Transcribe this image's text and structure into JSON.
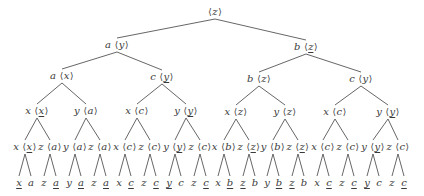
{
  "diagram": {
    "type": "tree",
    "line_color": "#555555",
    "text_color": "#3a3a3a",
    "nodes": [
      {
        "id": "n0",
        "label": "",
        "tag": "z",
        "tag_underlined": false,
        "x": 215,
        "y": 12,
        "parent": null
      },
      {
        "id": "n1",
        "label": "a",
        "tag": "y",
        "tag_underlined": false,
        "x": 117,
        "y": 45,
        "parent": "n0"
      },
      {
        "id": "n2",
        "label": "b",
        "tag": "z",
        "tag_underlined": true,
        "x": 306,
        "y": 47,
        "parent": "n0"
      },
      {
        "id": "n3",
        "label": "a",
        "tag": "x",
        "tag_underlined": false,
        "x": 62,
        "y": 76,
        "parent": "n1"
      },
      {
        "id": "n4",
        "label": "c",
        "tag": "y",
        "tag_underlined": true,
        "x": 162,
        "y": 77,
        "parent": "n1"
      },
      {
        "id": "n5",
        "label": "b",
        "tag": "z",
        "tag_underlined": false,
        "x": 259,
        "y": 79,
        "parent": "n2"
      },
      {
        "id": "n6",
        "label": "c",
        "tag": "y",
        "tag_underlined": false,
        "x": 361,
        "y": 79,
        "parent": "n2"
      },
      {
        "id": "n7",
        "label": "x",
        "tag": "x",
        "tag_underlined": true,
        "x": 37,
        "y": 111,
        "parent": "n3"
      },
      {
        "id": "n8",
        "label": "y",
        "tag": "a",
        "tag_underlined": false,
        "x": 86,
        "y": 111,
        "parent": "n3"
      },
      {
        "id": "n9",
        "label": "x",
        "tag": "c",
        "tag_underlined": false,
        "x": 137,
        "y": 111,
        "parent": "n4"
      },
      {
        "id": "n10",
        "label": "y",
        "tag": "y",
        "tag_underlined": true,
        "x": 186,
        "y": 111,
        "parent": "n4"
      },
      {
        "id": "n11",
        "label": "x",
        "tag": "z",
        "tag_underlined": false,
        "x": 236,
        "y": 112,
        "parent": "n5"
      },
      {
        "id": "n12",
        "label": "y",
        "tag": "z",
        "tag_underlined": false,
        "x": 285,
        "y": 112,
        "parent": "n5"
      },
      {
        "id": "n13",
        "label": "x",
        "tag": "c",
        "tag_underlined": false,
        "x": 335,
        "y": 112,
        "parent": "n6"
      },
      {
        "id": "n14",
        "label": "y",
        "tag": "y",
        "tag_underlined": true,
        "x": 388,
        "y": 112,
        "parent": "n6"
      },
      {
        "id": "n15",
        "label": "x",
        "tag": "x",
        "tag_underlined": true,
        "x": 25,
        "y": 147,
        "parent": "n7"
      },
      {
        "id": "n16",
        "label": "z",
        "tag": "a",
        "tag_underlined": false,
        "x": 50,
        "y": 147,
        "parent": "n7"
      },
      {
        "id": "n17",
        "label": "y",
        "tag": "a",
        "tag_underlined": false,
        "x": 75,
        "y": 147,
        "parent": "n8"
      },
      {
        "id": "n18",
        "label": "z",
        "tag": "a",
        "tag_underlined": false,
        "x": 100,
        "y": 147,
        "parent": "n8"
      },
      {
        "id": "n19",
        "label": "x",
        "tag": "c",
        "tag_underlined": false,
        "x": 125,
        "y": 147,
        "parent": "n9"
      },
      {
        "id": "n20",
        "label": "z",
        "tag": "c",
        "tag_underlined": false,
        "x": 150,
        "y": 147,
        "parent": "n9"
      },
      {
        "id": "n21",
        "label": "y",
        "tag": "y",
        "tag_underlined": true,
        "x": 175,
        "y": 147,
        "parent": "n10"
      },
      {
        "id": "n22",
        "label": "z",
        "tag": "c",
        "tag_underlined": false,
        "x": 200,
        "y": 147,
        "parent": "n10"
      },
      {
        "id": "n23",
        "label": "x",
        "tag": "b",
        "tag_underlined": false,
        "x": 224,
        "y": 147,
        "parent": "n11"
      },
      {
        "id": "n24",
        "label": "z",
        "tag": "z",
        "tag_underlined": true,
        "x": 249,
        "y": 147,
        "parent": "n11"
      },
      {
        "id": "n25",
        "label": "y",
        "tag": "b",
        "tag_underlined": false,
        "x": 273,
        "y": 147,
        "parent": "n12"
      },
      {
        "id": "n26",
        "label": "z",
        "tag": "z",
        "tag_underlined": true,
        "x": 298,
        "y": 147,
        "parent": "n12"
      },
      {
        "id": "n27",
        "label": "x",
        "tag": "c",
        "tag_underlined": false,
        "x": 323,
        "y": 147,
        "parent": "n13"
      },
      {
        "id": "n28",
        "label": "z",
        "tag": "c",
        "tag_underlined": false,
        "x": 348,
        "y": 147,
        "parent": "n13"
      },
      {
        "id": "n29",
        "label": "y",
        "tag": "y",
        "tag_underlined": true,
        "x": 373,
        "y": 147,
        "parent": "n14"
      },
      {
        "id": "n30",
        "label": "z",
        "tag": "c",
        "tag_underlined": false,
        "x": 398,
        "y": 147,
        "parent": "n14"
      }
    ],
    "leaves": [
      {
        "text": "x",
        "underlined": true,
        "x": 19,
        "parent": "n15"
      },
      {
        "text": "a",
        "underlined": false,
        "x": 31,
        "parent": "n15"
      },
      {
        "text": "z",
        "underlined": false,
        "x": 44,
        "parent": "n16"
      },
      {
        "text": "a",
        "underlined": true,
        "x": 56,
        "parent": "n16"
      },
      {
        "text": "y",
        "underlined": false,
        "x": 69,
        "parent": "n17"
      },
      {
        "text": "a",
        "underlined": true,
        "x": 81,
        "parent": "n17"
      },
      {
        "text": "z",
        "underlined": false,
        "x": 94,
        "parent": "n18"
      },
      {
        "text": "a",
        "underlined": true,
        "x": 106,
        "parent": "n18"
      },
      {
        "text": "x",
        "underlined": false,
        "x": 119,
        "parent": "n19"
      },
      {
        "text": "c",
        "underlined": true,
        "x": 131,
        "parent": "n19"
      },
      {
        "text": "z",
        "underlined": false,
        "x": 144,
        "parent": "n20"
      },
      {
        "text": "c",
        "underlined": true,
        "x": 156,
        "parent": "n20"
      },
      {
        "text": "y",
        "underlined": true,
        "x": 169,
        "parent": "n21"
      },
      {
        "text": "c",
        "underlined": false,
        "x": 181,
        "parent": "n21"
      },
      {
        "text": "z",
        "underlined": false,
        "x": 194,
        "parent": "n22"
      },
      {
        "text": "c",
        "underlined": true,
        "x": 206,
        "parent": "n22"
      },
      {
        "text": "x",
        "underlined": false,
        "x": 218,
        "parent": "n23"
      },
      {
        "text": "b",
        "underlined": true,
        "x": 230,
        "parent": "n23"
      },
      {
        "text": "z",
        "underlined": true,
        "x": 243,
        "parent": "n24"
      },
      {
        "text": "b",
        "underlined": false,
        "x": 255,
        "parent": "n24"
      },
      {
        "text": "y",
        "underlined": false,
        "x": 267,
        "parent": "n25"
      },
      {
        "text": "b",
        "underlined": true,
        "x": 279,
        "parent": "n25"
      },
      {
        "text": "z",
        "underlined": true,
        "x": 292,
        "parent": "n26"
      },
      {
        "text": "b",
        "underlined": false,
        "x": 304,
        "parent": "n26"
      },
      {
        "text": "x",
        "underlined": false,
        "x": 317,
        "parent": "n27"
      },
      {
        "text": "c",
        "underlined": true,
        "x": 329,
        "parent": "n27"
      },
      {
        "text": "z",
        "underlined": false,
        "x": 342,
        "parent": "n28"
      },
      {
        "text": "c",
        "underlined": true,
        "x": 354,
        "parent": "n28"
      },
      {
        "text": "y",
        "underlined": true,
        "x": 367,
        "parent": "n29"
      },
      {
        "text": "c",
        "underlined": false,
        "x": 379,
        "parent": "n29"
      },
      {
        "text": "z",
        "underlined": false,
        "x": 392,
        "parent": "n30"
      },
      {
        "text": "c",
        "underlined": true,
        "x": 404,
        "parent": "n30"
      }
    ],
    "leaf_y": 183,
    "brackets": {
      "open": "⟨",
      "close": "⟩"
    }
  }
}
